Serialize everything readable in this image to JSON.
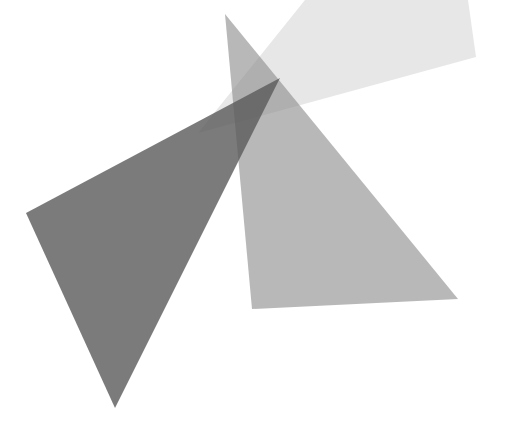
{
  "image": {
    "width": 517,
    "height": 427,
    "background": "#ffffff",
    "description": "Abstract composition of three overlapping translucent gray polygons"
  },
  "shapes": [
    {
      "name": "light-quadrilateral",
      "points": "305,0 468,0 476,57 198,133",
      "fill": "#b0b0b0",
      "opacity": 0.3
    },
    {
      "name": "medium-triangle",
      "points": "225,14 458,299 252,309",
      "fill": "#8c8c8c",
      "opacity": 0.62
    },
    {
      "name": "dark-triangle",
      "points": "26,213 280,78 115,408",
      "fill": "#5a5a5a",
      "opacity": 0.8
    }
  ]
}
